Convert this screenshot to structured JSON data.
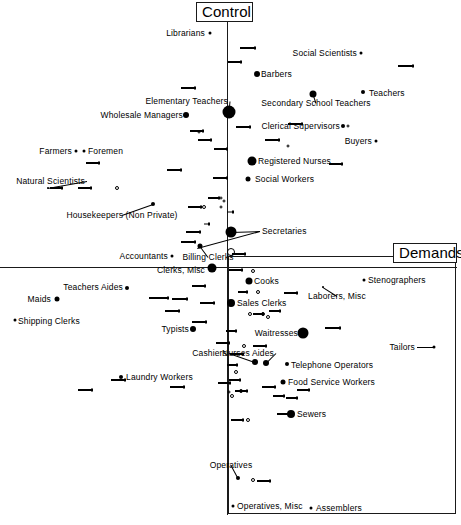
{
  "figure": {
    "axis_titles": {
      "vertical": "Control",
      "horizontal": "Demands"
    }
  },
  "chart_data": {
    "type": "scatter",
    "title": "",
    "subtitle": "",
    "xlabel": "Demands",
    "ylabel": "Control",
    "grid": false,
    "legend": "none",
    "axis_style": "crossed axes at origin; lower-right quadrant outlined with a rectangle",
    "xlim": [
      0,
      461
    ],
    "ylim": [
      0,
      525
    ],
    "origin_px": {
      "x": 227,
      "y": 267
    },
    "quadrant_box_px": {
      "x": 228,
      "y": 256,
      "w": 228,
      "h": 258
    },
    "axis_title_boxes": [
      {
        "name": "control-title-box",
        "label": "Control",
        "x": 196,
        "y": 2,
        "w": 57,
        "h": 20
      },
      {
        "name": "demands-title-box",
        "label": "Demands",
        "x": 393,
        "y": 243,
        "w": 64,
        "h": 20
      }
    ],
    "points": [
      {
        "label": "Librarians",
        "label_side": "right",
        "lx": 205,
        "ly": 33,
        "x": 210,
        "y": 33,
        "size": 3
      },
      {
        "label": "Social Scientists",
        "label_side": "right",
        "lx": 357,
        "ly": 53,
        "x": 361,
        "y": 53,
        "size": 3
      },
      {
        "label": "Barbers",
        "label_side": "left",
        "lx": 261,
        "ly": 74,
        "x": 257,
        "y": 74,
        "size": 6
      },
      {
        "label": "Teachers",
        "label_side": "left",
        "lx": 369,
        "ly": 93,
        "x": 363,
        "y": 92,
        "size": 4
      },
      {
        "label": "Elementary Teachers",
        "label_side": "right",
        "lx": 228,
        "ly": 101,
        "x": 229,
        "y": 112,
        "size": 13
      },
      {
        "label": "Secondary School Teachers",
        "label_side": "top",
        "lx": 316,
        "ly": 103,
        "x": 313,
        "y": 94,
        "size": 7
      },
      {
        "label": "Wholesale Managers",
        "label_side": "right",
        "lx": 183,
        "ly": 115,
        "x": 186,
        "y": 115,
        "size": 6
      },
      {
        "label": "Clerical Supervisors",
        "label_side": "right",
        "lx": 340,
        "ly": 126,
        "x": 343,
        "y": 126,
        "size": 4
      },
      {
        "label": "Buyers",
        "label_side": "right",
        "lx": 372,
        "ly": 141,
        "x": 376,
        "y": 141,
        "size": 3
      },
      {
        "label": "Farmers",
        "label_side": "right",
        "lx": 72,
        "ly": 151,
        "x": 76,
        "y": 151,
        "size": 3
      },
      {
        "label": "Foremen",
        "label_side": "left",
        "lx": 88,
        "ly": 151,
        "x": 84,
        "y": 151,
        "size": 3
      },
      {
        "label": "Registered Nurses",
        "label_side": "left",
        "lx": 258,
        "ly": 161,
        "x": 252,
        "y": 161,
        "size": 9
      },
      {
        "label": "Social Workers",
        "label_side": "left",
        "lx": 255,
        "ly": 179,
        "x": 248,
        "y": 179,
        "size": 5
      },
      {
        "label": "Natural Scientists",
        "label_side": "right",
        "lx": 85,
        "ly": 181,
        "x": 48,
        "y": 188,
        "size": 2
      },
      {
        "label": "Housekeepers (Non Private)",
        "label_side": "top",
        "lx": 122,
        "ly": 215,
        "x": 153,
        "y": 204,
        "size": 4
      },
      {
        "label": "Secretaries",
        "label_side": "left",
        "lx": 262,
        "ly": 231,
        "x": 231,
        "y": 232,
        "size": 11
      },
      {
        "label": "Accountants",
        "label_side": "right",
        "lx": 168,
        "ly": 256,
        "x": 172,
        "y": 256,
        "size": 3
      },
      {
        "label": "Billing Clerks",
        "label_side": "top",
        "lx": 208,
        "ly": 257,
        "x": 200,
        "y": 246,
        "size": 5
      },
      {
        "label": "Clerks, Misc",
        "label_side": "right",
        "lx": 205,
        "ly": 270,
        "x": 212,
        "y": 268,
        "size": 9
      },
      {
        "label": "Cooks",
        "label_side": "left",
        "lx": 254,
        "ly": 281,
        "x": 249,
        "y": 281,
        "size": 7
      },
      {
        "label": "Stenographers",
        "label_side": "left",
        "lx": 368,
        "ly": 280,
        "x": 364,
        "y": 280,
        "size": 3
      },
      {
        "label": "Teachers Aides",
        "label_side": "right",
        "lx": 123,
        "ly": 287,
        "x": 127,
        "y": 288,
        "size": 4
      },
      {
        "label": "Laborers, Misc",
        "label_side": "top",
        "lx": 337,
        "ly": 296,
        "x": 323,
        "y": 287,
        "size": 2
      },
      {
        "label": "Maids",
        "label_side": "right",
        "lx": 51,
        "ly": 299,
        "x": 57,
        "y": 299,
        "size": 5
      },
      {
        "label": "Sales Clerks",
        "label_side": "left",
        "lx": 237,
        "ly": 303,
        "x": 231,
        "y": 303,
        "size": 8
      },
      {
        "label": "Shipping Clerks",
        "label_side": "left",
        "lx": 18,
        "ly": 321,
        "x": 15,
        "y": 320,
        "size": 3
      },
      {
        "label": "Typists",
        "label_side": "right",
        "lx": 189,
        "ly": 329,
        "x": 193,
        "y": 329,
        "size": 6
      },
      {
        "label": "Waitresses",
        "label_side": "right",
        "lx": 298,
        "ly": 333,
        "x": 303,
        "y": 333,
        "size": 11
      },
      {
        "label": "Tailors",
        "label_side": "right",
        "lx": 415,
        "ly": 347,
        "x": 434,
        "y": 347,
        "size": 3
      },
      {
        "label": "Cashiers",
        "label_side": "right",
        "lx": 227,
        "ly": 353,
        "x": 255,
        "y": 362,
        "size": 6
      },
      {
        "label": "Nurses Aides",
        "label_side": "right",
        "lx": 274,
        "ly": 353,
        "x": 266,
        "y": 363,
        "size": 6
      },
      {
        "label": "Telephone Operators",
        "label_side": "left",
        "lx": 291,
        "ly": 365,
        "x": 287,
        "y": 364,
        "size": 4
      },
      {
        "label": "Laundry Workers",
        "label_side": "left",
        "lx": 126,
        "ly": 377,
        "x": 121,
        "y": 377,
        "size": 4
      },
      {
        "label": "Food Service Workers",
        "label_side": "left",
        "lx": 288,
        "ly": 382,
        "x": 283,
        "y": 382,
        "size": 5
      },
      {
        "label": "Sewers",
        "label_side": "left",
        "lx": 297,
        "ly": 414,
        "x": 291,
        "y": 414,
        "size": 8
      },
      {
        "label": "Operatives",
        "label_side": "top",
        "lx": 231,
        "ly": 465,
        "x": 238,
        "y": 478,
        "size": 4
      },
      {
        "label": "Operatives, Misc",
        "label_side": "left",
        "lx": 237,
        "ly": 506,
        "x": 233,
        "y": 506,
        "size": 3
      },
      {
        "label": "Assemblers",
        "label_side": "left",
        "lx": 316,
        "ly": 508,
        "x": 311,
        "y": 508,
        "size": 3
      }
    ],
    "unlabeled_open_circles": [
      {
        "x": 117,
        "y": 188,
        "d": 4
      },
      {
        "x": 204,
        "y": 207,
        "d": 4
      },
      {
        "x": 221,
        "y": 198,
        "d": 3
      },
      {
        "x": 224,
        "y": 201,
        "d": 3
      },
      {
        "x": 231,
        "y": 252,
        "d": 8
      },
      {
        "x": 348,
        "y": 126,
        "d": 3
      },
      {
        "x": 288,
        "y": 146,
        "d": 3
      },
      {
        "x": 253,
        "y": 271,
        "d": 4
      },
      {
        "x": 258,
        "y": 292,
        "d": 4
      },
      {
        "x": 250,
        "y": 314,
        "d": 4
      },
      {
        "x": 263,
        "y": 314,
        "d": 4
      },
      {
        "x": 268,
        "y": 317,
        "d": 4
      },
      {
        "x": 244,
        "y": 346,
        "d": 4
      },
      {
        "x": 236,
        "y": 372,
        "d": 4
      },
      {
        "x": 241,
        "y": 391,
        "d": 4
      },
      {
        "x": 232,
        "y": 396,
        "d": 4
      },
      {
        "x": 229,
        "y": 392,
        "d": 3
      },
      {
        "x": 248,
        "y": 420,
        "d": 4
      },
      {
        "x": 253,
        "y": 480,
        "d": 4
      },
      {
        "x": 221,
        "y": 207,
        "d": 3
      },
      {
        "x": 199,
        "y": 132,
        "d": 3
      }
    ],
    "unlabeled_segments": [
      {
        "x": 78,
        "y": 390,
        "w": 13
      },
      {
        "x": 111,
        "y": 380,
        "w": 13
      },
      {
        "x": 170,
        "y": 387,
        "w": 13
      },
      {
        "x": 218,
        "y": 383,
        "w": 11
      },
      {
        "x": 78,
        "y": 188,
        "w": 12
      },
      {
        "x": 50,
        "y": 188,
        "w": 11
      },
      {
        "x": 86,
        "y": 163,
        "w": 12
      },
      {
        "x": 167,
        "y": 170,
        "w": 13
      },
      {
        "x": 213,
        "y": 178,
        "w": 13
      },
      {
        "x": 190,
        "y": 131,
        "w": 12
      },
      {
        "x": 198,
        "y": 140,
        "w": 12
      },
      {
        "x": 214,
        "y": 149,
        "w": 12
      },
      {
        "x": 236,
        "y": 127,
        "w": 13
      },
      {
        "x": 265,
        "y": 140,
        "w": 13
      },
      {
        "x": 329,
        "y": 164,
        "w": 12
      },
      {
        "x": 398,
        "y": 66,
        "w": 14
      },
      {
        "x": 181,
        "y": 88,
        "w": 13
      },
      {
        "x": 240,
        "y": 48,
        "w": 14
      },
      {
        "x": 228,
        "y": 62,
        "w": 12
      },
      {
        "x": 204,
        "y": 224,
        "w": 4
      },
      {
        "x": 186,
        "y": 232,
        "w": 13
      },
      {
        "x": 181,
        "y": 242,
        "w": 13
      },
      {
        "x": 227,
        "y": 212,
        "w": 5
      },
      {
        "x": 188,
        "y": 207,
        "w": 12
      },
      {
        "x": 208,
        "y": 198,
        "w": 10
      },
      {
        "x": 232,
        "y": 254,
        "w": 12
      },
      {
        "x": 229,
        "y": 270,
        "w": 12
      },
      {
        "x": 192,
        "y": 286,
        "w": 12
      },
      {
        "x": 149,
        "y": 298,
        "w": 18
      },
      {
        "x": 172,
        "y": 299,
        "w": 14
      },
      {
        "x": 165,
        "y": 311,
        "w": 13
      },
      {
        "x": 200,
        "y": 303,
        "w": 13
      },
      {
        "x": 192,
        "y": 322,
        "w": 13
      },
      {
        "x": 238,
        "y": 292,
        "w": 8
      },
      {
        "x": 284,
        "y": 293,
        "w": 12
      },
      {
        "x": 226,
        "y": 331,
        "w": 9
      },
      {
        "x": 216,
        "y": 343,
        "w": 12
      },
      {
        "x": 253,
        "y": 346,
        "w": 12
      },
      {
        "x": 325,
        "y": 328,
        "w": 14
      },
      {
        "x": 230,
        "y": 354,
        "w": 12
      },
      {
        "x": 253,
        "y": 314,
        "w": 9
      },
      {
        "x": 269,
        "y": 311,
        "w": 10
      },
      {
        "x": 227,
        "y": 365,
        "w": 9
      },
      {
        "x": 262,
        "y": 387,
        "w": 12
      },
      {
        "x": 229,
        "y": 380,
        "w": 10
      },
      {
        "x": 235,
        "y": 391,
        "w": 11
      },
      {
        "x": 273,
        "y": 396,
        "w": 10
      },
      {
        "x": 286,
        "y": 398,
        "w": 10
      },
      {
        "x": 277,
        "y": 414,
        "w": 11
      },
      {
        "x": 231,
        "y": 420,
        "w": 11
      },
      {
        "x": 257,
        "y": 481,
        "w": 12
      },
      {
        "x": 288,
        "y": 124,
        "w": 13
      },
      {
        "x": 297,
        "y": 390,
        "w": 11
      }
    ]
  }
}
